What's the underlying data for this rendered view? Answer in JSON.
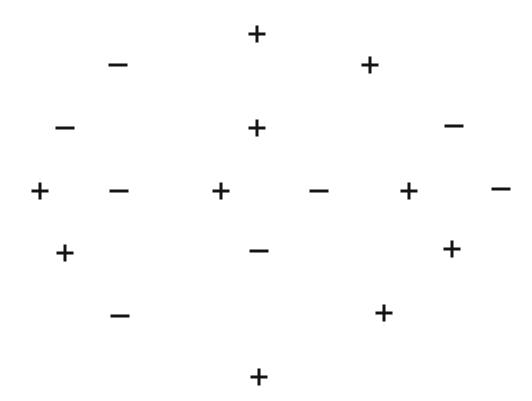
{
  "page": {
    "width": 532,
    "height": 401,
    "background_color": "#ffffff",
    "ink_color": "#141414"
  },
  "legend": {
    "plus_label": "+",
    "minus_label": "−"
  },
  "symbols": [
    {
      "id": 1,
      "glyph": "+",
      "kind": "plus",
      "x": 257,
      "y": 34,
      "w": 17,
      "h": 17,
      "t": 3
    },
    {
      "id": 2,
      "glyph": "−",
      "kind": "minus",
      "x": 118,
      "y": 65,
      "w": 19,
      "h": 3,
      "t": 3
    },
    {
      "id": 3,
      "glyph": "+",
      "kind": "plus",
      "x": 370,
      "y": 65,
      "w": 17,
      "h": 17,
      "t": 3
    },
    {
      "id": 4,
      "glyph": "−",
      "kind": "minus",
      "x": 65,
      "y": 128,
      "w": 19,
      "h": 3,
      "t": 3
    },
    {
      "id": 5,
      "glyph": "+",
      "kind": "plus",
      "x": 257,
      "y": 128,
      "w": 17,
      "h": 17,
      "t": 3
    },
    {
      "id": 6,
      "glyph": "−",
      "kind": "minus",
      "x": 454,
      "y": 126,
      "w": 19,
      "h": 3,
      "t": 3
    },
    {
      "id": 7,
      "glyph": "+",
      "kind": "plus",
      "x": 40,
      "y": 191,
      "w": 17,
      "h": 17,
      "t": 3
    },
    {
      "id": 8,
      "glyph": "−",
      "kind": "minus",
      "x": 119,
      "y": 191,
      "w": 19,
      "h": 3,
      "t": 3
    },
    {
      "id": 9,
      "glyph": "+",
      "kind": "plus",
      "x": 221,
      "y": 191,
      "w": 17,
      "h": 17,
      "t": 3
    },
    {
      "id": 10,
      "glyph": "−",
      "kind": "minus",
      "x": 319,
      "y": 191,
      "w": 19,
      "h": 3,
      "t": 3
    },
    {
      "id": 11,
      "glyph": "+",
      "kind": "plus",
      "x": 409,
      "y": 191,
      "w": 17,
      "h": 17,
      "t": 3
    },
    {
      "id": 12,
      "glyph": "−",
      "kind": "minus",
      "x": 501,
      "y": 189,
      "w": 19,
      "h": 3,
      "t": 3
    },
    {
      "id": 13,
      "glyph": "+",
      "kind": "plus",
      "x": 65,
      "y": 253,
      "w": 17,
      "h": 17,
      "t": 3
    },
    {
      "id": 14,
      "glyph": "−",
      "kind": "minus",
      "x": 259,
      "y": 251,
      "w": 19,
      "h": 3,
      "t": 3
    },
    {
      "id": 15,
      "glyph": "+",
      "kind": "plus",
      "x": 452,
      "y": 249,
      "w": 17,
      "h": 17,
      "t": 3
    },
    {
      "id": 16,
      "glyph": "−",
      "kind": "minus",
      "x": 120,
      "y": 316,
      "w": 19,
      "h": 3,
      "t": 3
    },
    {
      "id": 17,
      "glyph": "+",
      "kind": "plus",
      "x": 384,
      "y": 313,
      "w": 17,
      "h": 17,
      "t": 3
    },
    {
      "id": 18,
      "glyph": "+",
      "kind": "plus",
      "x": 259,
      "y": 377,
      "w": 17,
      "h": 17,
      "t": 3
    }
  ],
  "counts": {
    "plus": 10,
    "minus": 8,
    "total": 18
  }
}
